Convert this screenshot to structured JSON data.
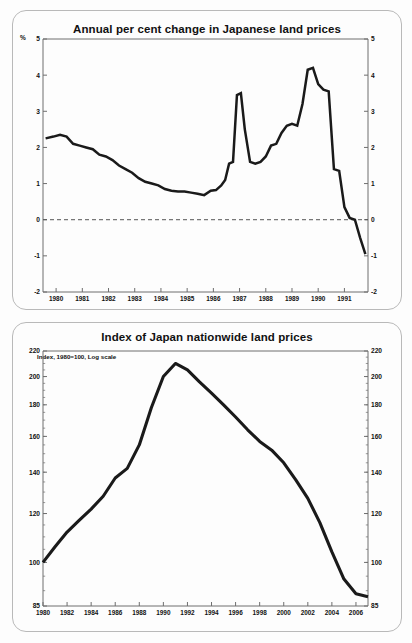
{
  "page": {
    "background": "#fdfdfd",
    "line_color": "#1a1a1a",
    "axis_color": "#6e6e6e",
    "panel_border": "#b9b9b9"
  },
  "panels": [
    {
      "name": "annual-change-panel",
      "title": "Annual per cent change in Japanese land prices",
      "unit_label": "%"
    },
    {
      "name": "index-panel",
      "title": "Index of Japan nationwide land prices",
      "annotation": "Index, 1980=100, Log scale"
    }
  ],
  "chart_data": [
    {
      "type": "line",
      "name": "annual-per-cent-change",
      "title": "Annual per cent change in Japanese land prices",
      "xlabel": "",
      "ylabel": "%",
      "ylim": [
        -2,
        5
      ],
      "yticks": [
        -2,
        -1,
        0,
        1,
        2,
        3,
        4,
        5
      ],
      "ytick_labels": [
        "-2",
        "-1",
        "0",
        "1",
        "2",
        "3",
        "4",
        "5"
      ],
      "xlim": [
        1979.5,
        1991.9
      ],
      "xticks": [
        1980,
        1981,
        1982,
        1983,
        1984,
        1985,
        1986,
        1987,
        1988,
        1989,
        1990,
        1991
      ],
      "xtick_labels": [
        "1980",
        "1981",
        "1982",
        "1983",
        "1984",
        "1985",
        "1986",
        "1987",
        "1988",
        "1989",
        "1990",
        "1991"
      ],
      "grid": false,
      "zero_line": true,
      "zero_line_style": "dashed",
      "x": [
        1979.6,
        1979.9,
        1980.15,
        1980.4,
        1980.65,
        1980.9,
        1981.15,
        1981.4,
        1981.65,
        1981.9,
        1982.15,
        1982.4,
        1982.65,
        1982.9,
        1983.15,
        1983.4,
        1983.65,
        1983.9,
        1984.15,
        1984.4,
        1984.65,
        1984.9,
        1985.15,
        1985.4,
        1985.65,
        1985.9,
        1986.1,
        1986.3,
        1986.45,
        1986.6,
        1986.75,
        1986.9,
        1987.05,
        1987.2,
        1987.4,
        1987.6,
        1987.8,
        1988.0,
        1988.2,
        1988.4,
        1988.6,
        1988.8,
        1989.0,
        1989.2,
        1989.4,
        1989.6,
        1989.8,
        1990.0,
        1990.2,
        1990.4,
        1990.6,
        1990.8,
        1991.0,
        1991.2,
        1991.4,
        1991.6,
        1991.8
      ],
      "y": [
        2.25,
        2.3,
        2.35,
        2.3,
        2.1,
        2.05,
        2.0,
        1.95,
        1.8,
        1.75,
        1.65,
        1.5,
        1.4,
        1.3,
        1.15,
        1.05,
        1.0,
        0.95,
        0.85,
        0.8,
        0.78,
        0.78,
        0.75,
        0.72,
        0.68,
        0.8,
        0.82,
        0.95,
        1.1,
        1.55,
        1.6,
        3.45,
        3.5,
        2.5,
        1.6,
        1.55,
        1.6,
        1.75,
        2.05,
        2.1,
        2.4,
        2.6,
        2.65,
        2.6,
        3.2,
        4.15,
        4.2,
        3.75,
        3.6,
        3.55,
        1.4,
        1.35,
        0.35,
        0.05,
        0.0,
        -0.5,
        -0.95
      ]
    },
    {
      "type": "line",
      "name": "nationwide-land-price-index",
      "title": "Index of Japan nationwide land prices",
      "annotation": "Index, 1980=100, Log scale",
      "xlabel": "",
      "ylabel": "",
      "yscale": "log",
      "ylim": [
        85,
        220
      ],
      "yticks": [
        85,
        100,
        120,
        140,
        160,
        180,
        200,
        220
      ],
      "ytick_labels": [
        "85",
        "100",
        "120",
        "140",
        "160",
        "180",
        "200",
        "220"
      ],
      "xlim": [
        1980,
        2007
      ],
      "xticks": [
        1980,
        1982,
        1984,
        1986,
        1988,
        1990,
        1992,
        1994,
        1996,
        1998,
        2000,
        2002,
        2004,
        2006
      ],
      "xtick_labels": [
        "1980",
        "1982",
        "1984",
        "1986",
        "1988",
        "1990",
        "1992",
        "1994",
        "1996",
        "1998",
        "2000",
        "2002",
        "2004",
        "2006"
      ],
      "grid": false,
      "x": [
        1980,
        1981,
        1982,
        1983,
        1984,
        1985,
        1986,
        1987,
        1988,
        1989,
        1990,
        1991,
        1992,
        1993,
        1994,
        1995,
        1996,
        1997,
        1998,
        1999,
        2000,
        2001,
        2002,
        2003,
        2004,
        2005,
        2006,
        2007
      ],
      "y": [
        100,
        106,
        112,
        117,
        122,
        128,
        137,
        142,
        155,
        178,
        200,
        210,
        205,
        196,
        188,
        180,
        172,
        164,
        157,
        152,
        145,
        136,
        127,
        116,
        104,
        94,
        89,
        88
      ]
    }
  ]
}
